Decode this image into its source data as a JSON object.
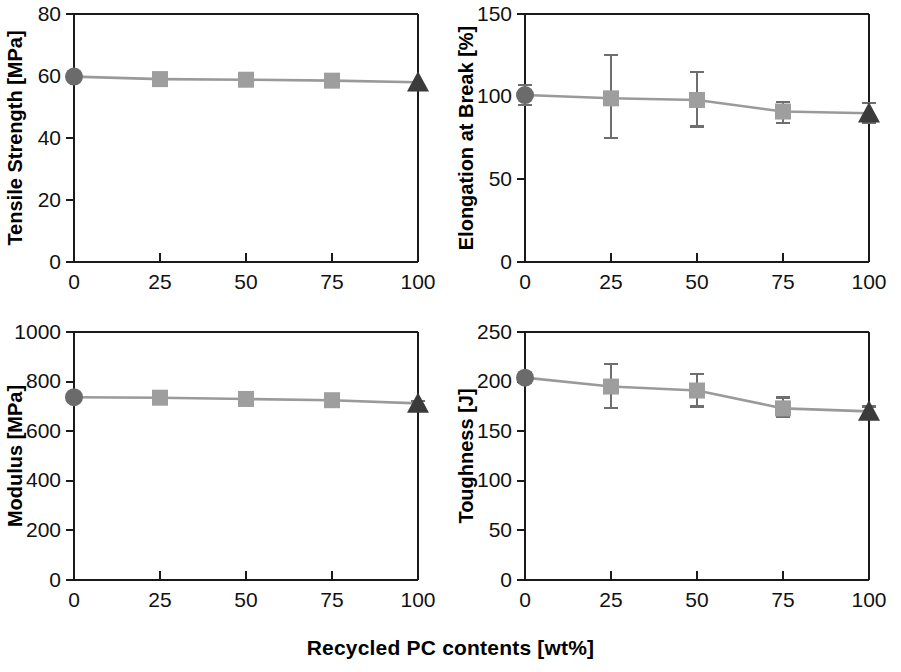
{
  "figure": {
    "shared_xlabel": "Recycled PC contents [wt%]",
    "x_categories": [
      0,
      25,
      50,
      75,
      100
    ],
    "x_tick_labels": [
      "0",
      "25",
      "50",
      "75",
      "100"
    ],
    "marker_colors": {
      "circle": "#6b6b6b",
      "square": "#9e9e9e",
      "triangle": "#3b3b3b",
      "line": "#9a9a9a",
      "errorbar": "#6e6e6e",
      "axis": "#1a1a1a"
    }
  },
  "chart_data": [
    {
      "type": "line",
      "panel": "top-left",
      "title": "",
      "xlabel": "Recycled PC contents [wt%]",
      "ylabel": "Tensile Strength [MPa]",
      "x": [
        0,
        25,
        50,
        75,
        100
      ],
      "values": [
        59.8,
        59.0,
        58.8,
        58.5,
        58.0
      ],
      "yerr_low": [
        0,
        0,
        0,
        0,
        0
      ],
      "yerr_high": [
        0,
        0,
        0,
        0,
        0
      ],
      "marker_shapes": [
        "circle",
        "square",
        "square",
        "square",
        "triangle"
      ],
      "xlim": [
        0,
        100
      ],
      "ylim": [
        0,
        80
      ],
      "yticks": [
        0,
        20,
        40,
        60,
        80
      ],
      "ytick_labels": [
        "0",
        "20",
        "40",
        "60",
        "80"
      ],
      "xticks": [
        0,
        25,
        50,
        75,
        100
      ],
      "xtick_labels": [
        "0",
        "25",
        "50",
        "75",
        "100"
      ],
      "grid": false,
      "legend": "none"
    },
    {
      "type": "line",
      "panel": "top-right",
      "title": "",
      "xlabel": "Recycled PC contents [wt%]",
      "ylabel": "Elongation at Break [%]",
      "x": [
        0,
        25,
        50,
        75,
        100
      ],
      "values": [
        101,
        99,
        98,
        91,
        90
      ],
      "yerr_low": [
        6,
        24,
        16,
        7,
        6
      ],
      "yerr_high": [
        6,
        26,
        17,
        6,
        6
      ],
      "marker_shapes": [
        "circle",
        "square",
        "square",
        "square",
        "triangle"
      ],
      "xlim": [
        0,
        100
      ],
      "ylim": [
        0,
        150
      ],
      "yticks": [
        0,
        50,
        100,
        150
      ],
      "ytick_labels": [
        "0",
        "50",
        "100",
        "150"
      ],
      "xticks": [
        0,
        25,
        50,
        75,
        100
      ],
      "xtick_labels": [
        "0",
        "25",
        "50",
        "75",
        "100"
      ],
      "grid": false,
      "legend": "none"
    },
    {
      "type": "line",
      "panel": "bottom-left",
      "title": "",
      "xlabel": "Recycled PC contents [wt%]",
      "ylabel": "Modulus [MPa]",
      "x": [
        0,
        25,
        50,
        75,
        100
      ],
      "values": [
        737,
        735,
        730,
        725,
        712
      ],
      "yerr_low": [
        16,
        12,
        18,
        18,
        10
      ],
      "yerr_high": [
        16,
        12,
        18,
        18,
        10
      ],
      "marker_shapes": [
        "circle",
        "square",
        "square",
        "square",
        "triangle"
      ],
      "xlim": [
        0,
        100
      ],
      "ylim": [
        0,
        1000
      ],
      "yticks": [
        0,
        200,
        400,
        600,
        800,
        1000
      ],
      "ytick_labels": [
        "0",
        "200",
        "400",
        "600",
        "800",
        "1000"
      ],
      "xticks": [
        0,
        25,
        50,
        75,
        100
      ],
      "xtick_labels": [
        "0",
        "25",
        "50",
        "75",
        "100"
      ],
      "grid": false,
      "legend": "none"
    },
    {
      "type": "line",
      "panel": "bottom-right",
      "title": "",
      "xlabel": "Recycled PC contents [wt%]",
      "ylabel": "Toughness [J]",
      "x": [
        0,
        25,
        50,
        75,
        100
      ],
      "values": [
        204,
        195,
        191,
        173,
        170
      ],
      "yerr_low": [
        5,
        22,
        16,
        9,
        5
      ],
      "yerr_high": [
        5,
        23,
        17,
        11,
        5
      ],
      "marker_shapes": [
        "circle",
        "square",
        "square",
        "square",
        "triangle"
      ],
      "xlim": [
        0,
        100
      ],
      "ylim": [
        0,
        250
      ],
      "yticks": [
        0,
        50,
        100,
        150,
        200,
        250
      ],
      "ytick_labels": [
        "0",
        "50",
        "100",
        "150",
        "200",
        "250"
      ],
      "xticks": [
        0,
        25,
        50,
        75,
        100
      ],
      "xtick_labels": [
        "0",
        "25",
        "50",
        "75",
        "100"
      ],
      "grid": false,
      "legend": "none"
    }
  ]
}
